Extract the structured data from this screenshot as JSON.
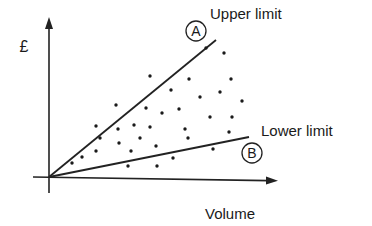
{
  "diagram": {
    "y_axis_label": "£",
    "x_axis_label": "Volume",
    "upper_line": {
      "label": "Upper limit",
      "marker": "A"
    },
    "lower_line": {
      "label": "Lower limit",
      "marker": "B"
    }
  },
  "chart_data": {
    "type": "scatter",
    "title": "",
    "xlabel": "Volume",
    "ylabel": "£",
    "grid": false,
    "lines": [
      {
        "name": "Upper limit",
        "marker": "A",
        "from": [
          0,
          0
        ],
        "to": [
          167,
          137
        ]
      },
      {
        "name": "Lower limit",
        "marker": "B",
        "from": [
          0,
          0
        ],
        "to": [
          200,
          40
        ]
      }
    ],
    "points": [
      [
        157,
        129
      ],
      [
        175,
        124
      ],
      [
        101,
        101
      ],
      [
        140,
        98
      ],
      [
        182,
        98
      ],
      [
        122,
        87
      ],
      [
        171,
        85
      ],
      [
        151,
        80
      ],
      [
        193,
        76
      ],
      [
        67,
        72
      ],
      [
        97,
        69
      ],
      [
        130,
        68
      ],
      [
        113,
        64
      ],
      [
        161,
        60
      ],
      [
        183,
        60
      ],
      [
        47,
        51
      ],
      [
        69,
        48
      ],
      [
        85,
        52
      ],
      [
        101,
        50
      ],
      [
        136,
        48
      ],
      [
        51,
        39
      ],
      [
        91,
        39
      ],
      [
        139,
        39
      ],
      [
        180,
        45
      ],
      [
        70,
        34
      ],
      [
        107,
        31
      ],
      [
        47,
        26
      ],
      [
        82,
        26
      ],
      [
        164,
        28
      ],
      [
        33,
        20
      ],
      [
        23,
        14
      ],
      [
        124,
        19
      ],
      [
        79,
        11
      ],
      [
        108,
        11
      ]
    ]
  }
}
